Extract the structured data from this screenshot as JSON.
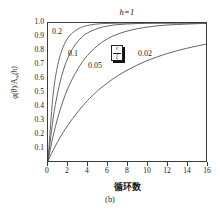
{
  "figure": {
    "caption": "(b)",
    "title": "h=1"
  },
  "axes": {
    "xlabel": "循环数",
    "ylabel_html": "φ(θ)/A∞(h)",
    "ylabel_phi": "φ(",
    "ylabel_theta": "θ",
    "ylabel_mid": ")/A",
    "ylabel_sub": "∞",
    "ylabel_tail": "(h)",
    "xticks": [
      0,
      2,
      4,
      6,
      8,
      10,
      12,
      14,
      16
    ],
    "yticks": [
      "0.1",
      "0.2",
      "0.3",
      "0.4",
      "0.5",
      "0.6",
      "0.7",
      "0.8",
      "0.9",
      "1.0"
    ],
    "xlim": [
      0,
      16
    ],
    "ylim": [
      0,
      1.0
    ]
  },
  "legend": {
    "boxed_symbol_numerator": "ε",
    "boxed_symbol_denominator": "ξ"
  },
  "series_labels": [
    {
      "text": "0.2",
      "left": 52,
      "top": 28
    },
    {
      "text": "0.1",
      "left": 68,
      "top": 50
    },
    {
      "text": "0.05",
      "left": 88,
      "top": 62
    },
    {
      "text": "0.02",
      "left": 138,
      "top": 50
    }
  ],
  "colors": {
    "background": "#ffffff",
    "axis": "#3a3a3a",
    "curve": "#555555",
    "text": "#1a1a1a"
  },
  "chart_data": {
    "type": "line",
    "title": "h=1",
    "xlabel": "循环数",
    "ylabel": "φ(θ)/A∞(h)",
    "xlim": [
      0,
      16
    ],
    "ylim": [
      0,
      1.0
    ],
    "grid": false,
    "legend_position": "inline-curve-labels",
    "x": [
      0,
      0.5,
      1,
      1.5,
      2,
      2.5,
      3,
      3.5,
      4,
      5,
      6,
      7,
      8,
      9,
      10,
      11,
      12,
      13,
      14,
      15,
      16
    ],
    "series": [
      {
        "name": "0.2",
        "values": [
          0.0,
          0.47,
          0.7,
          0.82,
          0.89,
          0.93,
          0.955,
          0.972,
          0.982,
          0.993,
          0.997,
          0.999,
          1.0,
          1.0,
          1.0,
          1.0,
          1.0,
          1.0,
          1.0,
          1.0,
          1.0
        ]
      },
      {
        "name": "0.1",
        "values": [
          0.0,
          0.3,
          0.5,
          0.645,
          0.745,
          0.815,
          0.865,
          0.902,
          0.928,
          0.96,
          0.978,
          0.988,
          0.993,
          0.996,
          0.998,
          0.999,
          1.0,
          1.0,
          1.0,
          1.0,
          1.0
        ]
      },
      {
        "name": "0.05",
        "values": [
          0.0,
          0.175,
          0.315,
          0.43,
          0.525,
          0.6,
          0.665,
          0.72,
          0.765,
          0.835,
          0.885,
          0.918,
          0.941,
          0.958,
          0.97,
          0.979,
          0.985,
          0.989,
          0.992,
          0.995,
          0.997
        ]
      },
      {
        "name": "0.02",
        "values": [
          0.0,
          0.075,
          0.142,
          0.203,
          0.258,
          0.308,
          0.355,
          0.398,
          0.438,
          0.507,
          0.565,
          0.615,
          0.657,
          0.694,
          0.726,
          0.753,
          0.777,
          0.798,
          0.816,
          0.832,
          0.846
        ]
      }
    ]
  }
}
